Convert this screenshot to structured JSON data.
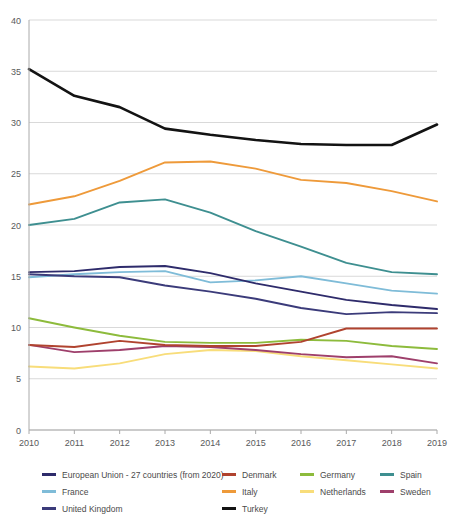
{
  "chart_data": {
    "type": "line",
    "title": "",
    "xlabel": "",
    "ylabel": "",
    "x": [
      2010,
      2011,
      2012,
      2013,
      2014,
      2015,
      2016,
      2017,
      2018,
      2019
    ],
    "xtick_labels": [
      "2010",
      "2011",
      "2012",
      "2013",
      "2014",
      "2015",
      "2016",
      "2017",
      "2018",
      "2019"
    ],
    "ylim": [
      0,
      40
    ],
    "yticks": [
      0,
      5,
      10,
      15,
      20,
      25,
      30,
      35,
      40
    ],
    "ytick_labels": [
      "0",
      "5",
      "10",
      "15",
      "20",
      "25",
      "30",
      "35",
      "40"
    ],
    "grid": true,
    "legend_position": "bottom",
    "series": [
      {
        "name": "European Union - 27 countries (from 2020)",
        "color": "#2e2b6b",
        "values": [
          15.4,
          15.5,
          15.9,
          16.0,
          15.3,
          14.3,
          13.5,
          12.7,
          12.2,
          11.8
        ]
      },
      {
        "name": "Denmark",
        "color": "#b0432f",
        "values": [
          8.3,
          8.1,
          8.7,
          8.3,
          8.2,
          8.2,
          8.6,
          9.9,
          9.9,
          9.9
        ]
      },
      {
        "name": "Germany",
        "color": "#8dbb3c",
        "values": [
          10.9,
          10.0,
          9.2,
          8.6,
          8.5,
          8.5,
          8.8,
          8.7,
          8.2,
          7.9
        ]
      },
      {
        "name": "Spain",
        "color": "#3e8f90",
        "values": [
          20.0,
          20.6,
          22.2,
          22.5,
          21.2,
          19.4,
          17.9,
          16.3,
          15.4,
          15.2
        ]
      },
      {
        "name": "France",
        "color": "#7fbcd8",
        "values": [
          14.9,
          15.2,
          15.4,
          15.5,
          14.4,
          14.6,
          15.0,
          14.3,
          13.6,
          13.3
        ]
      },
      {
        "name": "Italy",
        "color": "#ee9a3a",
        "values": [
          22.0,
          22.8,
          24.3,
          26.1,
          26.2,
          25.5,
          24.4,
          24.1,
          23.3,
          22.3
        ]
      },
      {
        "name": "Netherlands",
        "color": "#f8dd7a",
        "values": [
          6.2,
          6.0,
          6.5,
          7.4,
          7.8,
          7.7,
          7.2,
          6.8,
          6.4,
          6.0
        ]
      },
      {
        "name": "Sweden",
        "color": "#9e3f6b",
        "values": [
          8.3,
          7.6,
          7.8,
          8.2,
          8.1,
          7.8,
          7.4,
          7.1,
          7.2,
          6.5
        ]
      },
      {
        "name": "Turkey",
        "color": "#131313",
        "values": [
          35.2,
          32.6,
          31.5,
          29.4,
          28.8,
          28.3,
          27.9,
          27.8,
          27.8,
          29.8
        ]
      }
    ]
  },
  "legend": {
    "rows": [
      [
        {
          "name": "European Union - 27 countries (from 2020)",
          "color": "#2e2b6b"
        },
        {
          "name": "Denmark",
          "color": "#b0432f"
        },
        {
          "name": "Germany",
          "color": "#8dbb3c"
        },
        {
          "name": "Spain",
          "color": "#3e8f90"
        }
      ],
      [
        {
          "name": "France",
          "color": "#7fbcd8"
        },
        {
          "name": "Italy",
          "color": "#ee9a3a"
        },
        {
          "name": "Netherlands",
          "color": "#f8dd7a"
        },
        {
          "name": "Sweden",
          "color": "#9e3f6b"
        }
      ],
      [
        {
          "name": "United Kingdom",
          "color": "#3b3b7a"
        },
        {
          "name": "Turkey",
          "color": "#131313"
        }
      ]
    ]
  },
  "extra_series": [
    {
      "name": "United Kingdom",
      "color": "#3b3b7a",
      "values": [
        15.2,
        15.0,
        14.9,
        14.1,
        13.5,
        12.8,
        11.9,
        11.3,
        11.5,
        11.4
      ]
    }
  ],
  "axes": {
    "grid_color": "#d9d9d9",
    "axis_color": "#aaaaaa",
    "label_color": "#58595b"
  }
}
